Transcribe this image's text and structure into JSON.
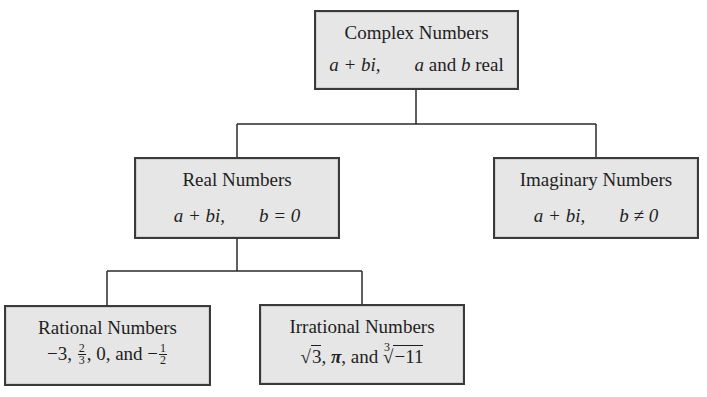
{
  "diagram": {
    "type": "tree",
    "colors": {
      "box_fill": "#e6e6e6",
      "box_border": "#3a3a3a",
      "line": "#2a2a2a",
      "text": "#1e1e1e"
    },
    "nodes": {
      "complex": {
        "title": "Complex Numbers",
        "formula_expr": "a + bi,",
        "formula_var_a": "a",
        "formula_cond_text": "and",
        "formula_var_b": "b",
        "formula_tail": "real"
      },
      "real": {
        "title": "Real Numbers",
        "formula_expr": "a + bi,",
        "formula_cond": "b = 0"
      },
      "imaginary": {
        "title": "Imaginary Numbers",
        "formula_expr": "a + bi,",
        "formula_cond": "b ≠ 0"
      },
      "rational": {
        "title": "Rational Numbers",
        "ex1": "−3,",
        "ex2_num": "2",
        "ex2_den": "3",
        "ex3": ", 0, and −",
        "ex4_num": "1",
        "ex4_den": "2"
      },
      "irrational": {
        "title": "Irrational Numbers",
        "sqrt_symbol": "√",
        "ex1_radicand": "3",
        "sep1": ", ",
        "pi": "π",
        "sep2": ", and ",
        "cbrt_index": "3",
        "cbrt_symbol": "√",
        "ex3_radicand": "−11"
      }
    },
    "edges": [
      {
        "from": "Complex Numbers",
        "to": "Real Numbers"
      },
      {
        "from": "Complex Numbers",
        "to": "Imaginary Numbers"
      },
      {
        "from": "Real Numbers",
        "to": "Rational Numbers"
      },
      {
        "from": "Real Numbers",
        "to": "Irrational Numbers"
      }
    ]
  }
}
